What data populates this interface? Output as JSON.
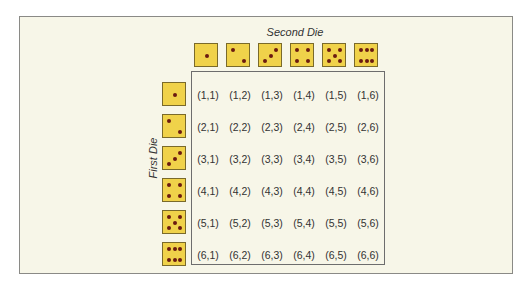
{
  "diagram": {
    "column_title": "Second Die",
    "row_title": "First Die",
    "die_faces": [
      1,
      2,
      3,
      4,
      5,
      6
    ],
    "rows": [
      [
        "(1,1)",
        "(1,2)",
        "(1,3)",
        "(1,4)",
        "(1,5)",
        "(1,6)"
      ],
      [
        "(2,1)",
        "(2,2)",
        "(2,3)",
        "(2,4)",
        "(2,5)",
        "(2,6)"
      ],
      [
        "(3,1)",
        "(3,2)",
        "(3,3)",
        "(3,4)",
        "(3,5)",
        "(3,6)"
      ],
      [
        "(4,1)",
        "(4,2)",
        "(4,3)",
        "(4,4)",
        "(4,5)",
        "(4,6)"
      ],
      [
        "(5,1)",
        "(5,2)",
        "(5,3)",
        "(5,4)",
        "(5,5)",
        "(5,6)"
      ],
      [
        "(6,1)",
        "(6,2)",
        "(6,3)",
        "(6,4)",
        "(6,5)",
        "(6,6)"
      ]
    ],
    "colors": {
      "die_face": "#f0d24a",
      "pip": "#6b1a10",
      "panel_bg": "#f7f6e8"
    }
  }
}
